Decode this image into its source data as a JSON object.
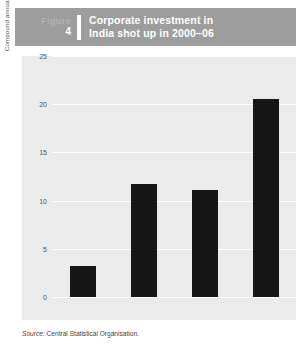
{
  "header": {
    "figure_word": "Figure",
    "figure_number": "4",
    "title_line1": "Corporate investment in",
    "title_line2": "India shot up in 2000–06",
    "band_color": "#9d9d9d",
    "text_color": "#ffffff"
  },
  "source": {
    "keyword": "Source:",
    "text": "Central Statistical Organisation."
  },
  "chart_data": {
    "type": "bar",
    "title": "Corporate investment in India shot up in 2000–06",
    "categories": [
      "1970–79",
      "1980–89",
      "1990–99",
      "2000–06"
    ],
    "values": [
      3.2,
      11.7,
      11.1,
      20.5
    ],
    "xlabel": "",
    "ylabel": "Compound annual growth rate of real corporate sector investment (%)",
    "ylim": [
      0,
      25
    ],
    "yticks": [
      0,
      5,
      10,
      15,
      20,
      25
    ],
    "ytick_labels": [
      "0",
      "5",
      "10",
      "15",
      "20",
      "25"
    ],
    "grid": "horizontal",
    "legend": "none",
    "bar_color": "#161616",
    "plot_background": "#ebebeb",
    "gridline_color": "#ffffff"
  }
}
